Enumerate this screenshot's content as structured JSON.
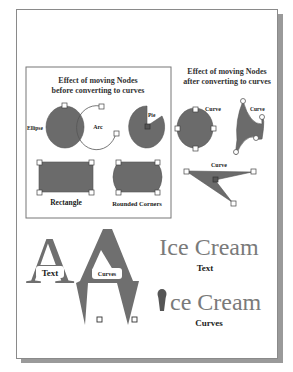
{
  "left_panel": {
    "title_line1": "Effect of moving Nodes",
    "title_line2": "before converting to curves",
    "labels": {
      "ellipse": "Ellipse",
      "arc": "Arc",
      "pie": "Pie",
      "rectangle": "Rectangle",
      "rounded_corners": "Rounded Corners"
    }
  },
  "right_panel": {
    "title_line1": "Effect of moving Nodes",
    "title_line2": "after converting to curves",
    "labels": {
      "curve_circle": "Curve",
      "curve_blob": "Curve",
      "curve_triangle": "Curve"
    }
  },
  "bottom": {
    "letter_text": {
      "glyph": "A",
      "caption": "Text"
    },
    "letter_curves": {
      "glyph": "A",
      "caption": "Curves"
    },
    "icecream_text": {
      "word": "Ice Cream",
      "caption": "Text"
    },
    "icecream_curves": {
      "word": "ce Cream",
      "caption": "Curves"
    }
  },
  "colors": {
    "shape_fill": "#6b6b6b",
    "text_gray": "#7a7a7a",
    "outline": "#444444"
  }
}
